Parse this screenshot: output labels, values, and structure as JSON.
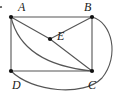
{
  "figure": {
    "kind": "plane-geometry-diagram",
    "canvas": {
      "width": 120,
      "height": 97
    },
    "stroke_color": "#555555",
    "point_color": "#111111",
    "background_color": "#ffffff",
    "stroke_width": 1.1,
    "points": [
      {
        "id": "A",
        "label": "A",
        "x": 11,
        "y": 17,
        "label_x": 18,
        "label_y": 1
      },
      {
        "id": "B",
        "label": "B",
        "x": 92,
        "y": 17,
        "label_x": 84,
        "label_y": 1
      },
      {
        "id": "C",
        "label": "C",
        "x": 92,
        "y": 71,
        "label_x": 88,
        "label_y": 79
      },
      {
        "id": "D",
        "label": "D",
        "x": 11,
        "y": 71,
        "label_x": 12,
        "label_y": 79
      },
      {
        "id": "E",
        "label": "E",
        "x": 50,
        "y": 39,
        "label_x": 57,
        "label_y": 30
      }
    ],
    "segments": [
      {
        "name": "side-AB",
        "from": "A",
        "to": "B"
      },
      {
        "name": "side-BC",
        "from": "B",
        "to": "C"
      },
      {
        "name": "side-CD",
        "from": "C",
        "to": "D"
      },
      {
        "name": "side-DA",
        "from": "D",
        "to": "A"
      },
      {
        "name": "segment-AE",
        "from": "A",
        "to": "E"
      },
      {
        "name": "segment-EB",
        "from": "E",
        "to": "B"
      },
      {
        "name": "segment-EC",
        "from": "E",
        "to": "C"
      }
    ],
    "arcs": [
      {
        "name": "arc-A-to-C",
        "from": "A",
        "to": "C",
        "path": "M 11 17 Q 22 64 92 71"
      },
      {
        "name": "arc-B-around-to-D",
        "from": "B",
        "to": "D",
        "path": "M 92 17 C 112 22 120 56 102 78 C 84 97 32 92 11 71"
      }
    ],
    "corner_mark": {
      "name": "crop-artifact-dot",
      "x": 1,
      "y": 7,
      "r": 1.1
    }
  }
}
